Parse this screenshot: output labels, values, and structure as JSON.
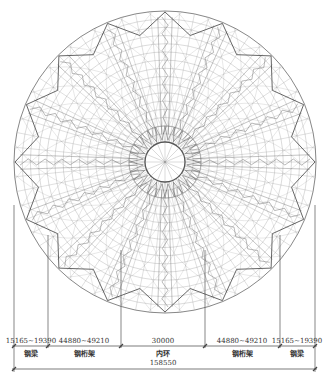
{
  "diagram": {
    "type": "dome-roof-plan",
    "center": [
      165,
      162
    ],
    "outer_radius": 151,
    "inner_ring_radius": 20,
    "radial_truss_count": 16,
    "perimeter_sawtooth_count": 16,
    "colors": {
      "line": "#7a7a7a",
      "line_dark": "#555555",
      "text": "#333333",
      "background": "#ffffff"
    }
  },
  "dimensions": {
    "segments": [
      {
        "value": "15165~19390",
        "label": "钢梁"
      },
      {
        "value": "44880~49210",
        "label": "钢桁架"
      },
      {
        "value": "30000",
        "label": "内环"
      },
      {
        "value": "44880~49210",
        "label": "钢桁架"
      },
      {
        "value": "15165~19390",
        "label": "钢梁"
      }
    ],
    "total": "158550"
  }
}
